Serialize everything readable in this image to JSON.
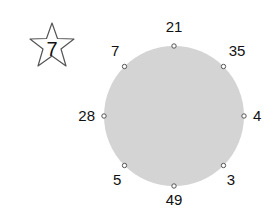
{
  "badge": {
    "shape": "star",
    "value": "7"
  },
  "circle": {
    "fill": "#d4d4d4",
    "cx": 174,
    "cy": 116,
    "r": 70
  },
  "nodes": [
    {
      "label": "21",
      "angle_deg": 90
    },
    {
      "label": "35",
      "angle_deg": 45
    },
    {
      "label": "4",
      "angle_deg": 0
    },
    {
      "label": "3",
      "angle_deg": -45
    },
    {
      "label": "49",
      "angle_deg": -90
    },
    {
      "label": "5",
      "angle_deg": -135
    },
    {
      "label": "28",
      "angle_deg": 180
    },
    {
      "label": "7",
      "angle_deg": 135
    }
  ]
}
